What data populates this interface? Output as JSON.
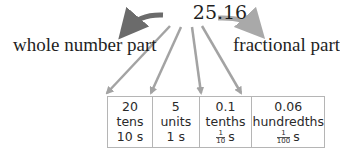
{
  "diagram": {
    "number": "25.16",
    "left_label": "whole number part",
    "right_label": "fractional part",
    "colors": {
      "whole_arrow": "#6b6b6b",
      "fractional_arrow": "#a9a9a9",
      "digit_arrows": "#a3a3a3",
      "table_border": "#b5b5b5"
    },
    "places": [
      {
        "value": "20",
        "name": "tens",
        "unit": "10 s"
      },
      {
        "value": "5",
        "name": "units",
        "unit": "1 s"
      },
      {
        "value": "0.1",
        "name": "tenths",
        "frac_num": "1",
        "frac_den": "10",
        "unit_suffix": "s"
      },
      {
        "value": "0.06",
        "name": "hundredths",
        "frac_num": "1",
        "frac_den": "100",
        "unit_suffix": "s"
      }
    ]
  }
}
